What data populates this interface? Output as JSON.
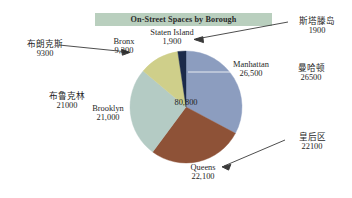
{
  "chart_data": {
    "type": "pie",
    "title": "On-Street Spaces by Borough",
    "total_label": "80,800",
    "total": 80800,
    "categories": [
      "Manhattan",
      "Queens",
      "Brooklyn",
      "Bronx",
      "Staten Island"
    ],
    "values": [
      26500,
      22100,
      21000,
      9300,
      1900
    ],
    "value_labels": [
      "26,500",
      "22,100",
      "21,000",
      "9,300",
      "1,900"
    ],
    "colors": [
      "#8c9dbf",
      "#8e5237",
      "#b4cbc4",
      "#cfcf8a",
      "#1b2a4a"
    ],
    "legend": "none",
    "grid": false,
    "slices": [
      {
        "name": "Manhattan",
        "value": 26500,
        "value_label": "26,500",
        "color": "#8c9dbf"
      },
      {
        "name": "Queens",
        "value": 22100,
        "value_label": "22,100",
        "color": "#8e5237"
      },
      {
        "name": "Brooklyn",
        "value": 21000,
        "value_label": "21,000",
        "color": "#b4cbc4"
      },
      {
        "name": "Bronx",
        "value": 9300,
        "value_label": "9,300",
        "color": "#cfcf8a"
      },
      {
        "name": "Staten Island",
        "value": 1900,
        "value_label": "1,900",
        "color": "#1b2a4a"
      }
    ]
  },
  "title": {
    "text": "On-Street Spaces by Borough",
    "banner_color": "#b9cfbe"
  },
  "chart_labels": {
    "staten_island": {
      "name": "Staten Island",
      "value": "1,900"
    },
    "bronx": {
      "name": "Bronx",
      "value": "9,300"
    },
    "manhattan": {
      "name": "Manhattan",
      "value": "26,500"
    },
    "brooklyn": {
      "name": "Brooklyn",
      "value": "21,000"
    },
    "queens": {
      "name": "Queens",
      "value": "22,100"
    },
    "total": "80,800"
  },
  "annotations": {
    "bronx": {
      "name": "布朗克斯",
      "value": "9300"
    },
    "brooklyn": {
      "name": "布鲁克林",
      "value": "21000"
    },
    "staten_island": {
      "name": "斯塔滕岛",
      "value": "1900"
    },
    "manhattan": {
      "name": "曼哈顿",
      "value": "26500"
    },
    "queens": {
      "name": "皇后区",
      "value": "22100"
    }
  }
}
